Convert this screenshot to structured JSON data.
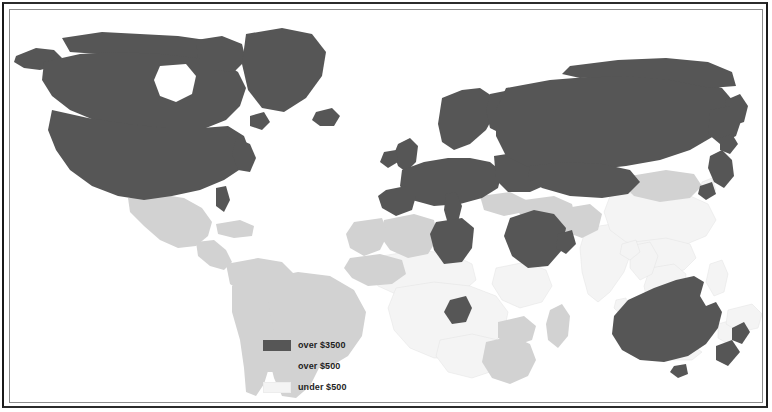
{
  "figure": {
    "kind": "thematic-choropleth-world-map",
    "title": "",
    "background_color": "#ffffff",
    "frame_color": "#1a1a1a",
    "inner_frame_color": "#8c8c8c"
  },
  "legend": {
    "position": "bottom-center-left",
    "items": [
      {
        "swatch_class": "sw-high",
        "label": "over $3500",
        "color": "#565656",
        "tier": "high"
      },
      {
        "swatch_class": "sw-mid",
        "label": "over $500",
        "color": "#d2d2d2",
        "tier": "middle"
      },
      {
        "swatch_class": "sw-low",
        "label": "under $500",
        "color": "#f4f4f4",
        "tier": "low"
      }
    ]
  },
  "chart_data": {
    "type": "map",
    "title": "",
    "subtitle": "",
    "xlabel": "",
    "ylabel": "",
    "projection": "equirectangular",
    "legend_position": "bottom-center",
    "grid": false,
    "ocean_color": "#ffffff",
    "categories": [
      "over $3500",
      "over $500",
      "under $500"
    ],
    "category_colors": {
      "over $3500": "#565656",
      "over $500": "#d2d2d2",
      "under $500": "#f4f4f4"
    },
    "regions": [
      {
        "name": "Canada",
        "category": "over $3500"
      },
      {
        "name": "United States",
        "category": "over $3500"
      },
      {
        "name": "Alaska",
        "category": "over $3500"
      },
      {
        "name": "Greenland",
        "category": "over $3500"
      },
      {
        "name": "Iceland",
        "category": "over $3500"
      },
      {
        "name": "United Kingdom",
        "category": "over $3500"
      },
      {
        "name": "Ireland",
        "category": "over $3500"
      },
      {
        "name": "Scandinavia",
        "category": "over $3500"
      },
      {
        "name": "Western Europe",
        "category": "over $3500"
      },
      {
        "name": "Soviet Union",
        "category": "over $3500"
      },
      {
        "name": "Japan",
        "category": "over $3500"
      },
      {
        "name": "Australia",
        "category": "over $3500"
      },
      {
        "name": "New Zealand",
        "category": "over $3500"
      },
      {
        "name": "Libya",
        "category": "over $3500"
      },
      {
        "name": "Saudi Arabia",
        "category": "over $3500"
      },
      {
        "name": "Gabon",
        "category": "over $3500"
      },
      {
        "name": "Mexico",
        "category": "over $500"
      },
      {
        "name": "Central America",
        "category": "over $500"
      },
      {
        "name": "South America",
        "category": "over $500"
      },
      {
        "name": "Bolivia",
        "category": "under $500"
      },
      {
        "name": "Algeria",
        "category": "over $500"
      },
      {
        "name": "South Africa",
        "category": "over $500"
      },
      {
        "name": "Turkey",
        "category": "over $500"
      },
      {
        "name": "Iran",
        "category": "over $500"
      },
      {
        "name": "Mongolia",
        "category": "over $500"
      },
      {
        "name": "Sub-Saharan Africa",
        "category": "under $500"
      },
      {
        "name": "India",
        "category": "under $500"
      },
      {
        "name": "China",
        "category": "under $500"
      },
      {
        "name": "Southeast Asia",
        "category": "under $500"
      },
      {
        "name": "Indonesia",
        "category": "under $500"
      }
    ]
  },
  "map_shapes": {
    "high": [
      {
        "name": "alaska",
        "d": "M6 46 L26 38 L44 40 L52 48 L46 56 L30 60 L14 58 L4 52 Z"
      },
      {
        "name": "canada-north-arctic",
        "d": "M52 28 L92 22 L130 24 L168 26 L196 30 L214 38 L206 48 L178 50 L150 46 L120 44 L88 44 L60 42 Z"
      },
      {
        "name": "canada-mainland",
        "d": "M34 52 L70 44 L108 42 L150 44 L186 48 L212 52 L228 62 L236 78 L230 96 L216 110 L196 118 L168 120 L140 118 L112 116 L84 110 L60 100 L42 86 L32 70 Z"
      },
      {
        "name": "hudson-bay-notch",
        "d": "M150 56 L176 54 L186 66 L182 84 L166 92 L150 86 L144 70 Z",
        "hole": true
      },
      {
        "name": "baffin",
        "d": "M186 30 L212 26 L232 34 L236 50 L224 62 L204 60 L188 48 Z"
      },
      {
        "name": "greenland",
        "d": "M236 24 L272 18 L302 24 L316 42 L312 66 L296 88 L274 102 L252 98 L238 80 L232 54 Z"
      },
      {
        "name": "usa-mainland",
        "d": "M42 100 L78 108 L118 114 L156 118 L192 118 L218 116 L234 126 L240 142 L232 158 L214 170 L190 180 L162 186 L134 190 L108 186 L82 176 L60 160 L46 140 L38 120 Z"
      },
      {
        "name": "florida",
        "d": "M206 178 L216 176 L220 190 L214 202 L206 196 Z"
      },
      {
        "name": "usa-east-coast",
        "d": "M226 128 L240 134 L246 148 L240 162 L228 160 L222 144 Z"
      },
      {
        "name": "newfoundland",
        "d": "M240 106 L254 102 L260 112 L252 120 L240 116 Z"
      },
      {
        "name": "iceland",
        "d": "M306 102 L322 98 L330 106 L324 116 L310 116 L302 110 Z"
      },
      {
        "name": "uk",
        "d": "M388 134 L400 128 L408 136 L406 152 L396 162 L388 156 L384 144 Z"
      },
      {
        "name": "ireland",
        "d": "M374 142 L386 140 L388 152 L378 158 L370 152 Z"
      },
      {
        "name": "scandinavia",
        "d": "M432 88 L452 80 L470 78 L482 86 L486 102 L476 120 L460 134 L444 140 L432 132 L428 114 Z"
      },
      {
        "name": "finland-baltic",
        "d": "M480 84 L500 80 L510 92 L506 112 L492 124 L480 118 L476 100 Z"
      },
      {
        "name": "europe-west",
        "d": "M392 160 L414 152 L438 148 L460 148 L480 152 L492 162 L488 178 L472 188 L450 194 L424 196 L402 190 L390 176 Z"
      },
      {
        "name": "iberia",
        "d": "M376 180 L396 176 L406 186 L402 200 L386 206 L372 198 L368 186 Z"
      },
      {
        "name": "italy",
        "d": "M436 184 L446 182 L452 196 L448 212 L438 214 L434 200 Z"
      },
      {
        "name": "europe-east",
        "d": "M484 146 L510 142 L534 146 L544 158 L538 174 L520 182 L498 182 L486 170 Z"
      },
      {
        "name": "ussr-main",
        "d": "M496 78 L540 70 L590 66 L640 66 L684 70 L712 78 L724 92 L720 110 L704 126 L680 140 L650 150 L616 156 L580 160 L546 160 L516 156 L496 146 L486 126 L486 100 Z"
      },
      {
        "name": "ussr-siberia-north",
        "d": "M560 56 L608 50 L656 48 L698 52 L722 62 L726 76 L700 78 L660 70 L612 66 L570 68 L552 64 Z"
      },
      {
        "name": "ussr-kamchatka",
        "d": "M716 90 L730 84 L738 96 L734 112 L722 116 L714 104 Z"
      },
      {
        "name": "ussr-far-east",
        "d": "M700 100 L720 96 L732 108 L726 126 L710 134 L698 124 Z"
      },
      {
        "name": "ussr-central-south",
        "d": "M520 156 L556 152 L592 154 L620 160 L630 172 L618 184 L592 188 L560 186 L532 178 L518 168 Z"
      },
      {
        "name": "libya",
        "d": "M426 212 L452 208 L464 218 L462 238 L452 252 L434 254 L424 240 L420 224 Z"
      },
      {
        "name": "saudi-arabia",
        "d": "M500 208 L524 200 L544 204 L556 218 L552 240 L538 256 L518 258 L502 246 L494 226 Z"
      },
      {
        "name": "arabia-tip",
        "d": "M548 224 L562 220 L566 234 L556 244 L546 238 Z"
      },
      {
        "name": "gabon",
        "d": "M440 290 L456 286 L462 298 L456 312 L442 314 L434 302 Z"
      },
      {
        "name": "japan-honshu",
        "d": "M700 146 L712 140 L722 150 L724 166 L714 178 L704 172 L698 158 Z"
      },
      {
        "name": "japan-north",
        "d": "M710 128 L722 124 L728 134 L720 144 L710 140 Z"
      },
      {
        "name": "japan-south",
        "d": "M690 176 L702 172 L706 184 L696 190 L688 184 Z"
      },
      {
        "name": "australia",
        "d": "M618 290 L644 278 L666 270 L684 266 L694 272 L690 286 L696 296 L706 292 L712 302 L708 318 L696 334 L678 346 L654 352 L630 350 L612 340 L602 324 L604 306 Z"
      },
      {
        "name": "tasmania",
        "d": "M664 356 L676 354 L678 364 L668 368 L660 362 Z"
      },
      {
        "name": "new-zealand-n",
        "d": "M722 318 L734 312 L740 322 L732 334 L722 330 Z"
      },
      {
        "name": "new-zealand-s",
        "d": "M706 336 L722 330 L730 342 L718 356 L706 350 Z"
      }
    ],
    "mid": [
      {
        "name": "mexico",
        "d": "M118 188 L148 184 L174 188 L192 198 L202 212 L198 226 L186 236 L168 238 L150 230 L134 216 L120 202 Z"
      },
      {
        "name": "central-america",
        "d": "M186 232 L204 230 L216 240 L222 252 L214 260 L200 256 L188 246 Z"
      },
      {
        "name": "cuba-caribbean",
        "d": "M206 214 L230 210 L244 216 L242 226 L224 228 L208 224 Z"
      },
      {
        "name": "colombia-venezuela",
        "d": "M216 254 L248 248 L272 252 L284 264 L280 280 L262 288 L238 286 L220 274 Z"
      },
      {
        "name": "brazil",
        "d": "M248 270 L288 262 L320 266 L344 280 L356 302 L352 326 L338 346 L318 358 L296 358 L278 346 L264 326 L254 302 L246 284 Z"
      },
      {
        "name": "peru-chile",
        "d": "M222 276 L246 272 L258 292 L264 320 L262 348 L254 374 L246 386 L236 382 L234 358 L230 330 L222 302 Z"
      },
      {
        "name": "argentina",
        "d": "M262 320 L292 318 L308 334 L310 356 L300 376 L286 388 L272 386 L264 368 L258 344 Z"
      },
      {
        "name": "algeria",
        "d": "M374 210 L404 204 L424 210 L428 228 L418 244 L398 248 L380 240 L370 226 Z"
      },
      {
        "name": "morocco-west-africa",
        "d": "M344 212 L372 208 L378 224 L370 240 L354 246 L340 238 L336 224 Z"
      },
      {
        "name": "west-africa-coast",
        "d": "M340 248 L370 244 L392 250 L396 264 L382 274 L358 276 L342 268 L334 258 Z"
      },
      {
        "name": "turkey",
        "d": "M470 186 L500 182 L516 190 L514 202 L494 206 L474 200 Z"
      },
      {
        "name": "iran-caucasus",
        "d": "M514 190 L544 186 L562 194 L566 210 L554 222 L532 224 L514 214 L508 200 Z"
      },
      {
        "name": "afghanistan-pakistan",
        "d": "M556 198 L580 194 L592 204 L588 220 L572 228 L556 222 L550 210 Z"
      },
      {
        "name": "mongolia",
        "d": "M620 166 L656 160 L684 164 L692 176 L680 188 L650 192 L624 186 L614 176 Z"
      },
      {
        "name": "south-africa",
        "d": "M476 332 L502 326 L520 334 L526 350 L518 366 L500 374 L482 368 L472 352 Z"
      },
      {
        "name": "madagascar",
        "d": "M540 300 L552 294 L560 306 L558 326 L548 338 L538 330 L536 314 Z"
      },
      {
        "name": "zambia-zimbabwe",
        "d": "M488 312 L514 306 L526 316 L522 330 L504 336 L488 328 Z"
      }
    ],
    "low": [
      {
        "name": "bolivia",
        "d": "M262 292 L286 288 L298 300 L296 318 L282 330 L264 326 L256 310 Z"
      },
      {
        "name": "africa-sahel",
        "d": "M372 246 L408 240 L442 244 L462 254 L466 270 L452 282 L422 288 L390 286 L368 276 L360 260 Z"
      },
      {
        "name": "africa-central",
        "d": "M386 278 L424 272 L460 276 L486 286 L498 302 L494 322 L478 338 L452 348 L424 348 L400 338 L384 320 L378 298 Z"
      },
      {
        "name": "africa-east-horn",
        "d": "M486 258 L516 252 L536 260 L542 276 L532 292 L510 298 L492 290 L482 274 Z"
      },
      {
        "name": "africa-south-interior",
        "d": "M430 330 L462 324 L488 330 L496 344 L486 360 L462 368 L438 362 L426 346 Z"
      },
      {
        "name": "india",
        "d": "M576 218 L602 214 L618 222 L622 240 L614 262 L600 282 L588 292 L578 284 L572 262 L570 238 Z"
      },
      {
        "name": "china",
        "d": "M600 186 L640 180 L676 184 L698 194 L706 210 L696 226 L672 236 L642 238 L616 232 L600 220 L594 202 Z"
      },
      {
        "name": "china-south",
        "d": "M624 232 L656 228 L680 234 L686 248 L674 260 L650 264 L628 256 L618 244 Z"
      },
      {
        "name": "korea",
        "d": "M692 172 L702 168 L706 180 L698 188 L690 182 Z"
      },
      {
        "name": "southeast-asia",
        "d": "M640 258 L664 254 L676 264 L674 284 L662 300 L648 306 L638 296 L634 276 Z"
      },
      {
        "name": "malaysia",
        "d": "M648 302 L668 298 L676 308 L668 318 L652 318 L644 310 Z"
      },
      {
        "name": "sumatra",
        "d": "M626 312 L648 306 L658 318 L646 334 L630 336 L620 326 Z"
      },
      {
        "name": "java",
        "d": "M646 338 L680 334 L692 342 L682 350 L654 350 L642 344 Z"
      },
      {
        "name": "borneo",
        "d": "M672 304 L696 300 L708 312 L702 326 L682 330 L670 320 Z"
      },
      {
        "name": "philippines",
        "d": "M700 254 L712 250 L718 264 L714 282 L704 286 L696 272 Z"
      },
      {
        "name": "sulawesi",
        "d": "M708 314 L722 310 L726 324 L718 334 L708 328 Z"
      },
      {
        "name": "new-guinea",
        "d": "M718 300 L742 294 L752 304 L748 318 L730 322 L716 314 Z"
      },
      {
        "name": "sri-lanka",
        "d": "M606 290 L616 288 L618 300 L610 304 L604 298 Z"
      },
      {
        "name": "burma-thailand",
        "d": "M620 236 L640 232 L648 246 L642 264 L630 270 L620 258 Z"
      },
      {
        "name": "bangladesh",
        "d": "M612 234 L626 230 L630 242 L620 250 L610 244 Z"
      }
    ]
  }
}
